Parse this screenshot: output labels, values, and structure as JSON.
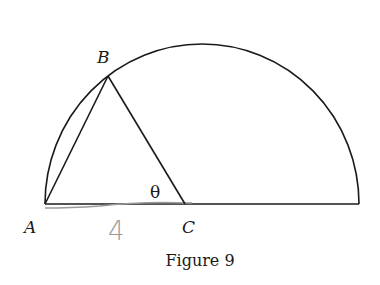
{
  "figure": {
    "caption": "Figure 9",
    "shape": "semicircle with inscribed triangle ABC",
    "points": {
      "A": {
        "label": "A",
        "x": 45,
        "y": 204
      },
      "B": {
        "label": "B",
        "x": 108,
        "y": 76
      },
      "C": {
        "label": "C",
        "x": 185,
        "y": 204
      },
      "diameter_end": {
        "x": 359,
        "y": 204
      }
    },
    "angle_label": "θ",
    "handwritten_length_label": "4",
    "colors": {
      "ink": "#1a1a1a",
      "pencil": "#9a9a9a",
      "background": "#ffffff"
    }
  }
}
